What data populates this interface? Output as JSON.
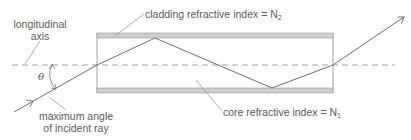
{
  "diagram": {
    "type": "optical-fiber-total-internal-reflection",
    "labels": {
      "longitudinal_axis_line1": "longitudinal",
      "longitudinal_axis_line2": "axis",
      "cladding_prefix": "cladding refractive index = N",
      "cladding_subscript": "2",
      "core_prefix": "core refractive index = N",
      "core_subscript": "1",
      "theta": "θ",
      "incident_line1": "maximum angle",
      "incident_line2": "of incident ray"
    },
    "colors": {
      "line": "#6e6e6e",
      "cladding_fill": "#cfcfcf",
      "axis_dash": "#8a8a8a",
      "text": "#5a5a5a"
    }
  }
}
